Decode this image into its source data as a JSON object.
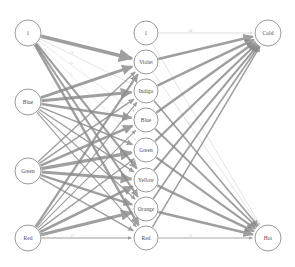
{
  "diagram": {
    "type": "neural-network",
    "background_color": "#ffffff",
    "edge_color": "#8a8a8a",
    "node_fill": "#ffffff",
    "node_stroke": "#8e8e8e",
    "label_color": "#4a4a4a",
    "edge_label_color": "#b9b9b9"
  },
  "layers": [
    {
      "name": "input-layer",
      "x": 28,
      "nodes": [
        {
          "id": "in-bias",
          "label": "1",
          "cx": 28,
          "cy": 33,
          "r": 13
        },
        {
          "id": "in-blue",
          "label": "Blue",
          "cx": 28,
          "cy": 102,
          "r": 13
        },
        {
          "id": "in-green",
          "label": "Green",
          "cx": 28,
          "cy": 171,
          "r": 13
        },
        {
          "id": "in-red",
          "label": "Red",
          "cx": 28,
          "cy": 238,
          "r": 13
        }
      ]
    },
    {
      "name": "hidden-layer",
      "x": 146,
      "nodes": [
        {
          "id": "h-bias",
          "label": "1",
          "cx": 146,
          "cy": 33,
          "r": 12
        },
        {
          "id": "h-violet",
          "label": "Violet",
          "cx": 146,
          "cy": 62,
          "r": 12
        },
        {
          "id": "h-indigo",
          "label": "Indigo",
          "cx": 146,
          "cy": 91,
          "r": 12
        },
        {
          "id": "h-blue",
          "label": "Blue",
          "cx": 146,
          "cy": 120,
          "r": 12
        },
        {
          "id": "h-green",
          "label": "Green",
          "cx": 146,
          "cy": 150,
          "r": 12
        },
        {
          "id": "h-yellow",
          "label": "Yellow",
          "cx": 146,
          "cy": 180,
          "r": 12
        },
        {
          "id": "h-orange",
          "label": "Orange",
          "cx": 146,
          "cy": 209,
          "r": 12
        },
        {
          "id": "h-red",
          "label": "Red",
          "cx": 146,
          "cy": 238,
          "r": 12
        }
      ]
    },
    {
      "name": "output-layer",
      "x": 268,
      "nodes": [
        {
          "id": "out-cold",
          "label": "Cold",
          "cx": 268,
          "cy": 33,
          "r": 13
        },
        {
          "id": "out-hot",
          "label": "Hot",
          "cx": 268,
          "cy": 238,
          "r": 13
        }
      ]
    }
  ],
  "edges": [
    {
      "from": "in-bias",
      "to": "h-violet",
      "weight": 3.6,
      "label": ""
    },
    {
      "from": "in-bias",
      "to": "h-indigo",
      "weight": 0.5,
      "label": ".25"
    },
    {
      "from": "in-bias",
      "to": "h-blue",
      "weight": 0.4,
      "label": ".19"
    },
    {
      "from": "in-bias",
      "to": "h-green",
      "weight": 0.4,
      "label": ".11"
    },
    {
      "from": "in-bias",
      "to": "h-yellow",
      "weight": 2.2,
      "label": ""
    },
    {
      "from": "in-bias",
      "to": "h-orange",
      "weight": 2.0,
      "label": ""
    },
    {
      "from": "in-bias",
      "to": "h-red",
      "weight": 2.4,
      "label": ""
    },
    {
      "from": "in-blue",
      "to": "h-violet",
      "weight": 2.8,
      "label": ""
    },
    {
      "from": "in-blue",
      "to": "h-indigo",
      "weight": 3.0,
      "label": ""
    },
    {
      "from": "in-blue",
      "to": "h-blue",
      "weight": 2.6,
      "label": ""
    },
    {
      "from": "in-blue",
      "to": "h-green",
      "weight": 1.6,
      "label": ""
    },
    {
      "from": "in-blue",
      "to": "h-yellow",
      "weight": 1.4,
      "label": ""
    },
    {
      "from": "in-blue",
      "to": "h-orange",
      "weight": 1.2,
      "label": ""
    },
    {
      "from": "in-blue",
      "to": "h-red",
      "weight": 1.1,
      "label": ""
    },
    {
      "from": "in-green",
      "to": "h-violet",
      "weight": 1.3,
      "label": ""
    },
    {
      "from": "in-green",
      "to": "h-indigo",
      "weight": 1.5,
      "label": ""
    },
    {
      "from": "in-green",
      "to": "h-blue",
      "weight": 2.6,
      "label": ""
    },
    {
      "from": "in-green",
      "to": "h-green",
      "weight": 3.2,
      "label": ""
    },
    {
      "from": "in-green",
      "to": "h-yellow",
      "weight": 3.0,
      "label": ""
    },
    {
      "from": "in-green",
      "to": "h-orange",
      "weight": 2.4,
      "label": ""
    },
    {
      "from": "in-green",
      "to": "h-red",
      "weight": 1.4,
      "label": ".14"
    },
    {
      "from": "in-red",
      "to": "h-violet",
      "weight": 2.2,
      "label": ""
    },
    {
      "from": "in-red",
      "to": "h-indigo",
      "weight": 1.2,
      "label": ""
    },
    {
      "from": "in-red",
      "to": "h-blue",
      "weight": 1.1,
      "label": ""
    },
    {
      "from": "in-red",
      "to": "h-green",
      "weight": 1.3,
      "label": ""
    },
    {
      "from": "in-red",
      "to": "h-yellow",
      "weight": 2.6,
      "label": ""
    },
    {
      "from": "in-red",
      "to": "h-orange",
      "weight": 3.0,
      "label": ""
    },
    {
      "from": "in-red",
      "to": "h-red",
      "weight": 1.0,
      "label": ".17"
    },
    {
      "from": "h-bias",
      "to": "out-cold",
      "weight": 0.6,
      "label": ".02"
    },
    {
      "from": "h-bias",
      "to": "out-hot",
      "weight": 0.5,
      "label": ""
    },
    {
      "from": "h-violet",
      "to": "out-cold",
      "weight": 2.6,
      "label": ""
    },
    {
      "from": "h-violet",
      "to": "out-hot",
      "weight": 0.5,
      "label": ".12"
    },
    {
      "from": "h-indigo",
      "to": "out-cold",
      "weight": 2.4,
      "label": ".17"
    },
    {
      "from": "h-indigo",
      "to": "out-hot",
      "weight": 1.6,
      "label": ""
    },
    {
      "from": "h-blue",
      "to": "out-cold",
      "weight": 2.4,
      "label": ""
    },
    {
      "from": "h-blue",
      "to": "out-hot",
      "weight": 1.8,
      "label": ""
    },
    {
      "from": "h-green",
      "to": "out-cold",
      "weight": 2.2,
      "label": ""
    },
    {
      "from": "h-green",
      "to": "out-hot",
      "weight": 2.0,
      "label": ""
    },
    {
      "from": "h-yellow",
      "to": "out-cold",
      "weight": 2.0,
      "label": ""
    },
    {
      "from": "h-yellow",
      "to": "out-hot",
      "weight": 2.4,
      "label": ""
    },
    {
      "from": "h-orange",
      "to": "out-cold",
      "weight": 1.7,
      "label": ".13"
    },
    {
      "from": "h-orange",
      "to": "out-hot",
      "weight": 2.6,
      "label": ""
    },
    {
      "from": "h-red",
      "to": "out-cold",
      "weight": 1.5,
      "label": ""
    },
    {
      "from": "h-red",
      "to": "out-hot",
      "weight": 0.9,
      "label": ".11"
    }
  ]
}
